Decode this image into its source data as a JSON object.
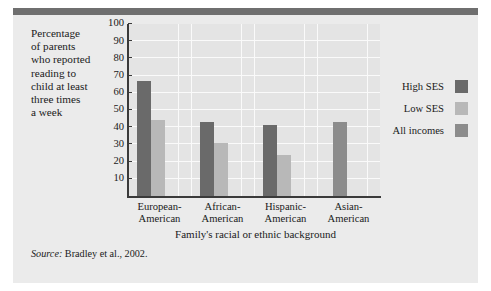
{
  "figure": {
    "background": "#ebebeb",
    "rule_color": "#6f6f6f",
    "plot_background": "#e4e4e4",
    "gridline_color": "#fafafa",
    "axis_color": "#3a3a3a"
  },
  "y_caption": "Percentage\nof parents\nwho reported\nreading to\nchild at least\nthree times\na week",
  "x_axis_title": "Family's racial or ethnic background",
  "source": {
    "label": "Source:",
    "text": " Bradley et al., 2002."
  },
  "legend": {
    "items": [
      {
        "label": "High SES",
        "color": "#6a6a6a"
      },
      {
        "label": "Low SES",
        "color": "#b8b8b8"
      },
      {
        "label": "All incomes",
        "color": "#8c8c8c"
      }
    ]
  },
  "chart_data": {
    "type": "bar",
    "title": "",
    "xlabel": "Family's racial or ethnic background",
    "ylabel": "Percentage of parents who reported reading to child at least three times a week",
    "ylim": [
      0,
      100
    ],
    "yticks": [
      10,
      20,
      30,
      40,
      50,
      60,
      70,
      80,
      90,
      100
    ],
    "grid": true,
    "legend_position": "right",
    "categories": [
      "European-\nAmerican",
      "African-\nAmerican",
      "Hispanic-\nAmerican",
      "Asian-\nAmerican"
    ],
    "series": [
      {
        "name": "High SES",
        "color": "#6a6a6a",
        "values": [
          67,
          43,
          41,
          null
        ]
      },
      {
        "name": "Low SES",
        "color": "#b8b8b8",
        "values": [
          44,
          31,
          24,
          null
        ]
      },
      {
        "name": "All incomes",
        "color": "#8c8c8c",
        "values": [
          null,
          null,
          null,
          43
        ]
      }
    ]
  }
}
